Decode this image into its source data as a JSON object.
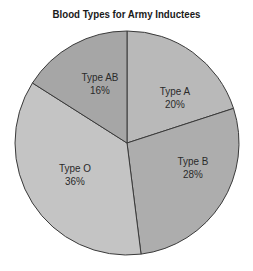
{
  "chart_data": {
    "type": "pie",
    "title": "Blood Types for Army Inductees",
    "categories": [
      "Type A",
      "Type B",
      "Type O",
      "Type AB"
    ],
    "values": [
      20,
      28,
      36,
      16
    ],
    "labels": [
      {
        "name": "Type A",
        "pct": "20%"
      },
      {
        "name": "Type B",
        "pct": "28%"
      },
      {
        "name": "Type O",
        "pct": "36%"
      },
      {
        "name": "Type AB",
        "pct": "16%"
      }
    ],
    "colors": [
      "#b9b9b9",
      "#adadad",
      "#c4c4c4",
      "#a6a6a6"
    ],
    "start_angle_deg": 0,
    "direction": "clockwise",
    "legend": "none"
  }
}
